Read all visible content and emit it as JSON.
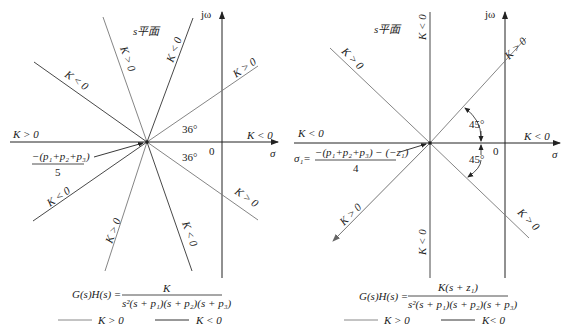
{
  "colors": {
    "k_pos_line": "#8a8a8a",
    "k_neg_line": "#333333",
    "axis": "#222222",
    "background": "#ffffff"
  },
  "left_figure": {
    "plane_label": "s平面",
    "axis_imag_label": "jω",
    "axis_real_label": "σ",
    "origin_label": "0",
    "angle_labels": [
      "36°",
      "36°"
    ],
    "centroid_numerator": "−(p₁+p₂+p₃)",
    "centroid_denominator": "5",
    "asymptote_labels": {
      "real_left": "K > 0",
      "real_right": "K < 0",
      "upper_left": "K < 0",
      "upper_steep_left": "K > 0",
      "upper_steep_right": "K < 0",
      "upper_right": "K > 0",
      "lower_left": "K < 0",
      "lower_steep_left": "K > 0",
      "lower_steep_right": "K < 0",
      "lower_right": "K > 0"
    },
    "transfer_function_lhs": "G(s)H(s) =",
    "transfer_function_numerator": "K",
    "transfer_function_denominator": "s²(s + p₁)(s + p₂)(s + p₃)",
    "legend": [
      {
        "label": "K > 0",
        "style": "light"
      },
      {
        "label": "K < 0",
        "style": "dark"
      }
    ]
  },
  "right_figure": {
    "plane_label": "s平面",
    "axis_imag_label": "jω",
    "axis_real_label": "σ",
    "origin_label": "0",
    "angle_labels": [
      "45°",
      "45°"
    ],
    "centroid_prefix": "σ₁=",
    "centroid_numerator": "−(p₁+p₂+p₃) − (−z₁)",
    "centroid_denominator": "4",
    "asymptote_labels": {
      "real_left": "K < 0",
      "real_right": "K < 0",
      "vertical_up": "K < 0",
      "vertical_down": "K < 0",
      "upper_left": "K > 0",
      "upper_right": "K > 0",
      "lower_left": "K > 0",
      "lower_right": "K > 0"
    },
    "transfer_function_lhs": "G(s)H(s) =",
    "transfer_function_numerator": "K(s + z₁)",
    "transfer_function_denominator": "s²(s + p₁)(s + p₂)(s + p₃)",
    "legend": [
      {
        "label": "K > 0",
        "style": "light"
      },
      {
        "label": "K< 0",
        "style": "dark"
      }
    ]
  }
}
